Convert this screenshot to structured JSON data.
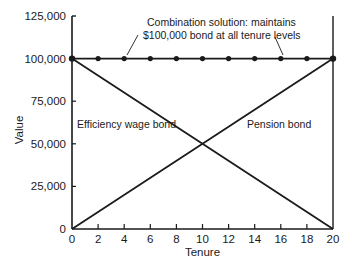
{
  "chart_data": {
    "type": "line",
    "title": "",
    "xlabel": "Tenure",
    "ylabel": "Value",
    "xlim": [
      0,
      20
    ],
    "ylim": [
      0,
      125000
    ],
    "x_ticks": [
      0,
      2,
      4,
      6,
      8,
      10,
      12,
      14,
      16,
      18,
      20
    ],
    "x_tick_labels": [
      "0",
      "2",
      "4",
      "6",
      "8",
      "10",
      "12",
      "14",
      "16",
      "18",
      "20"
    ],
    "y_ticks": [
      0,
      25000,
      50000,
      75000,
      100000,
      125000
    ],
    "y_tick_labels": [
      "0",
      "25,000",
      "50,000",
      "75,000",
      "100,000",
      "125,000"
    ],
    "grid": false,
    "legend": null,
    "series": [
      {
        "name": "Efficiency wage bond",
        "x": [
          0,
          20
        ],
        "values": [
          100000,
          0
        ],
        "markers": false
      },
      {
        "name": "Pension bond",
        "x": [
          0,
          20
        ],
        "values": [
          0,
          100000
        ],
        "markers": false
      },
      {
        "name": "Combination solution",
        "x": [
          0,
          2,
          4,
          6,
          8,
          10,
          12,
          14,
          16,
          18,
          20
        ],
        "values": [
          100000,
          100000,
          100000,
          100000,
          100000,
          100000,
          100000,
          100000,
          100000,
          100000,
          100000
        ],
        "markers": true
      }
    ],
    "annotations": [
      {
        "text_line1": "Combination solution: maintains",
        "text_line2": "$100,000 bond at all tenure levels",
        "points_to_x": [
          4,
          16
        ],
        "points_to_y": 100000
      },
      {
        "text": "Efficiency wage bond",
        "x": 0.3,
        "y": 60000
      },
      {
        "text": "Pension bond",
        "x": 13.2,
        "y": 60000
      }
    ]
  }
}
